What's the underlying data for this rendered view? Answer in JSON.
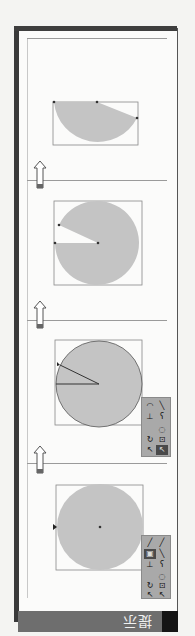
{
  "panel": {
    "title": "提示",
    "orientation": "rotated-180"
  },
  "steps": [
    {
      "id": 1,
      "shape": "full-circle",
      "description": "circle with center point"
    },
    {
      "id": 2,
      "shape": "circle-with-radius-lines",
      "description": "circle with two radius lines"
    },
    {
      "id": 3,
      "shape": "pie-wedge-cut",
      "description": "circle with wedge removed"
    },
    {
      "id": 4,
      "shape": "half-pie",
      "description": "partial pie segment"
    }
  ],
  "toolbox": {
    "icons": [
      "pencil-icon",
      "brush-icon",
      "fill-icon",
      "line-icon",
      "type-icon",
      "eyedropper-icon",
      "lasso-icon",
      "rotate-icon",
      "transform-icon",
      "arrow-icon",
      "subselect-icon"
    ]
  },
  "colors": {
    "shape_fill": "#c4c4c4",
    "border_dark": "#3a3a3a",
    "titlebar": "#6e6e6e"
  }
}
